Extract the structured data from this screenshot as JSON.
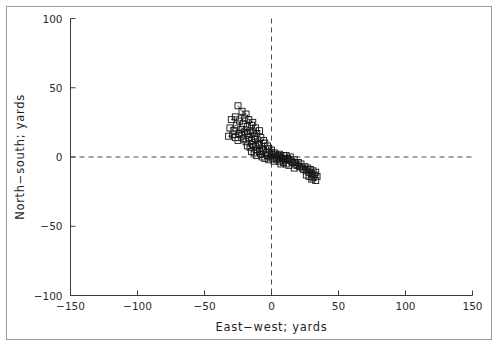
{
  "chart_data": {
    "type": "scatter",
    "title": "",
    "xlabel": "East−west; yards",
    "ylabel": "North−south; yards",
    "xlim": [
      -150,
      150
    ],
    "ylim": [
      -100,
      100
    ],
    "xticks": [
      -150,
      -100,
      -50,
      0,
      50,
      100,
      150
    ],
    "yticks": [
      -100,
      -50,
      0,
      50,
      100
    ],
    "xticklabels": [
      "−150",
      "−100",
      "−50",
      "0",
      "50",
      "100",
      "150"
    ],
    "yticklabels": [
      "−100",
      "−50",
      "0",
      "50",
      "100"
    ],
    "grid": false,
    "legend": null,
    "marker": "open-square",
    "connected": true,
    "reference_lines": [
      {
        "name": "x-zero",
        "orientation": "vertical",
        "value": 0,
        "style": "dashed"
      },
      {
        "name": "y-zero",
        "orientation": "horizontal",
        "value": 0,
        "style": "dashed"
      }
    ],
    "series": [
      {
        "name": "track",
        "points": [
          [
            -25,
            37
          ],
          [
            -22,
            33
          ],
          [
            -19,
            31
          ],
          [
            -27,
            29
          ],
          [
            -30,
            27
          ],
          [
            -24,
            26
          ],
          [
            -20,
            28
          ],
          [
            -17,
            27
          ],
          [
            -14,
            25
          ],
          [
            -21,
            24
          ],
          [
            -26,
            23
          ],
          [
            -31,
            21
          ],
          [
            -28,
            19
          ],
          [
            -23,
            20
          ],
          [
            -18,
            22
          ],
          [
            -15,
            23
          ],
          [
            -12,
            21
          ],
          [
            -16,
            19
          ],
          [
            -20,
            18
          ],
          [
            -24,
            17
          ],
          [
            -29,
            16
          ],
          [
            -32,
            15
          ],
          [
            -27,
            14
          ],
          [
            -22,
            16
          ],
          [
            -18,
            17
          ],
          [
            -14,
            18
          ],
          [
            -11,
            17
          ],
          [
            -9,
            19
          ],
          [
            -13,
            15
          ],
          [
            -17,
            14
          ],
          [
            -21,
            13
          ],
          [
            -25,
            12
          ],
          [
            -19,
            11
          ],
          [
            -15,
            12
          ],
          [
            -12,
            13
          ],
          [
            -8,
            14
          ],
          [
            -6,
            12
          ],
          [
            -10,
            10
          ],
          [
            -14,
            9
          ],
          [
            -18,
            8
          ],
          [
            -16,
            7
          ],
          [
            -12,
            8
          ],
          [
            -9,
            9
          ],
          [
            -5,
            10
          ],
          [
            -3,
            8
          ],
          [
            -7,
            6
          ],
          [
            -11,
            5
          ],
          [
            -15,
            4
          ],
          [
            -13,
            3
          ],
          [
            -9,
            4
          ],
          [
            -6,
            5
          ],
          [
            -2,
            6
          ],
          [
            0,
            5
          ],
          [
            -4,
            3
          ],
          [
            -8,
            2
          ],
          [
            -11,
            1
          ],
          [
            -7,
            0
          ],
          [
            -3,
            1
          ],
          [
            0,
            2
          ],
          [
            2,
            3
          ],
          [
            -1,
            0
          ],
          [
            -5,
            -1
          ],
          [
            -2,
            -2
          ],
          [
            1,
            -1
          ],
          [
            4,
            0
          ],
          [
            3,
            2
          ],
          [
            0,
            3
          ],
          [
            5,
            1
          ],
          [
            7,
            0
          ],
          [
            6,
            2
          ],
          [
            9,
            1
          ],
          [
            8,
            -1
          ],
          [
            4,
            -2
          ],
          [
            2,
            -3
          ],
          [
            6,
            -3
          ],
          [
            10,
            -2
          ],
          [
            12,
            -1
          ],
          [
            11,
            1
          ],
          [
            14,
            0
          ],
          [
            13,
            -2
          ],
          [
            9,
            -4
          ],
          [
            7,
            -5
          ],
          [
            11,
            -5
          ],
          [
            15,
            -3
          ],
          [
            17,
            -2
          ],
          [
            16,
            -4
          ],
          [
            13,
            -6
          ],
          [
            18,
            -5
          ],
          [
            20,
            -4
          ],
          [
            19,
            -6
          ],
          [
            22,
            -5
          ],
          [
            21,
            -7
          ],
          [
            17,
            -8
          ],
          [
            23,
            -8
          ],
          [
            25,
            -7
          ],
          [
            24,
            -9
          ],
          [
            27,
            -8
          ],
          [
            26,
            -10
          ],
          [
            29,
            -9
          ],
          [
            28,
            -11
          ],
          [
            31,
            -10
          ],
          [
            30,
            -12
          ],
          [
            33,
            -11
          ],
          [
            32,
            -13
          ],
          [
            34,
            -14
          ],
          [
            31,
            -15
          ],
          [
            33,
            -17
          ],
          [
            30,
            -16
          ],
          [
            28,
            -14
          ],
          [
            26,
            -13
          ]
        ]
      }
    ]
  },
  "axes": {
    "x_title": "East−west; yards",
    "y_title": "North−south; yards"
  },
  "colors": {
    "marker_stroke": "#151515",
    "line_stroke": "#202020",
    "axis": "#3a3a3a",
    "dashed": "#4a4a4a",
    "frame": "#9a9a9a",
    "background": "#ffffff"
  }
}
